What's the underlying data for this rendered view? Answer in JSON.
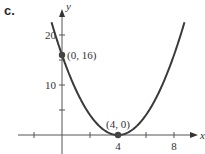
{
  "panel": {
    "label": "c."
  },
  "chart_data": {
    "type": "line",
    "title": "",
    "xlabel": "x",
    "ylabel": "y",
    "function": "y = (x - 4)^2",
    "xlim": [
      -3,
      10
    ],
    "ylim": [
      -3,
      25
    ],
    "x_ticks": [
      -2,
      2,
      4,
      6,
      8
    ],
    "x_tick_labels": {
      "4": "4",
      "8": "8"
    },
    "y_ticks": [
      5,
      10,
      15,
      20
    ],
    "y_tick_labels": {
      "10": "10",
      "20": "20"
    },
    "grid": false,
    "series": [
      {
        "name": "parabola",
        "x": [
          -0.7,
          0,
          1,
          2,
          3,
          4,
          5,
          6,
          7,
          8,
          8.7
        ],
        "y": [
          22.09,
          16,
          9,
          4,
          1,
          0,
          1,
          4,
          9,
          16,
          22.09
        ]
      }
    ],
    "points": [
      {
        "x": 0,
        "y": 16,
        "label": "(0, 16)"
      },
      {
        "x": 4,
        "y": 0,
        "label": "(4, 0)"
      }
    ],
    "color": "#3a3a3a"
  }
}
